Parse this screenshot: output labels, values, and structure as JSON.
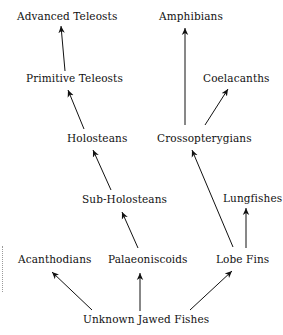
{
  "diagram": {
    "type": "evolutionary-tree",
    "nodes": [
      {
        "id": "advanced_teleosts",
        "label": "Advanced Teleosts"
      },
      {
        "id": "amphibians",
        "label": "Amphibians"
      },
      {
        "id": "primitive_teleosts",
        "label": "Primitive Teleosts"
      },
      {
        "id": "coelacanths",
        "label": "Coelacanths"
      },
      {
        "id": "holosteans",
        "label": "Holosteans"
      },
      {
        "id": "crossopterygians",
        "label": "Crossopterygians"
      },
      {
        "id": "sub_holosteans",
        "label": "Sub-Holosteans"
      },
      {
        "id": "lungfishes",
        "label": "Lungfishes"
      },
      {
        "id": "acanthodians",
        "label": "Acanthodians"
      },
      {
        "id": "palaeoniscoids",
        "label": "Palaeoniscoids"
      },
      {
        "id": "lobe_fins",
        "label": "Lobe Fins"
      },
      {
        "id": "unknown_jawed_fishes",
        "label": "Unknown Jawed Fishes"
      }
    ],
    "edges": [
      {
        "from": "unknown_jawed_fishes",
        "to": "acanthodians"
      },
      {
        "from": "unknown_jawed_fishes",
        "to": "palaeoniscoids"
      },
      {
        "from": "unknown_jawed_fishes",
        "to": "lobe_fins"
      },
      {
        "from": "palaeoniscoids",
        "to": "sub_holosteans"
      },
      {
        "from": "sub_holosteans",
        "to": "holosteans"
      },
      {
        "from": "holosteans",
        "to": "primitive_teleosts"
      },
      {
        "from": "primitive_teleosts",
        "to": "advanced_teleosts"
      },
      {
        "from": "lobe_fins",
        "to": "crossopterygians"
      },
      {
        "from": "lobe_fins",
        "to": "lungfishes"
      },
      {
        "from": "crossopterygians",
        "to": "coelacanths"
      },
      {
        "from": "crossopterygians",
        "to": "amphibians"
      }
    ]
  }
}
